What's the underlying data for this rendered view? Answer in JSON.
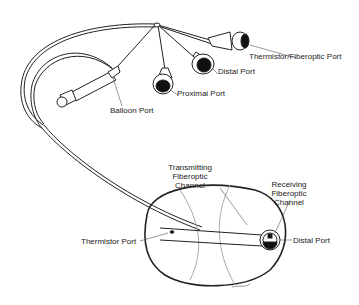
{
  "diagram": {
    "labels": {
      "thermistor_fiberoptic_port": "Thermistor/Fiberoptic Port",
      "distal_port_top": "Distal Port",
      "proximal_port": "Proximai Port",
      "balloon_port": "Balloon Port",
      "transmitting_1": "Transmitting",
      "transmitting_2": "Fiberoptic",
      "transmitting_3": "Channel",
      "receiving_1": "Receiving",
      "receiving_2": "Fiberoptic",
      "receiving_3": "Channel",
      "thermistor_port": "Thermistor Port",
      "distal_port_tip": "Distal Port"
    },
    "signature": "artist signature"
  }
}
